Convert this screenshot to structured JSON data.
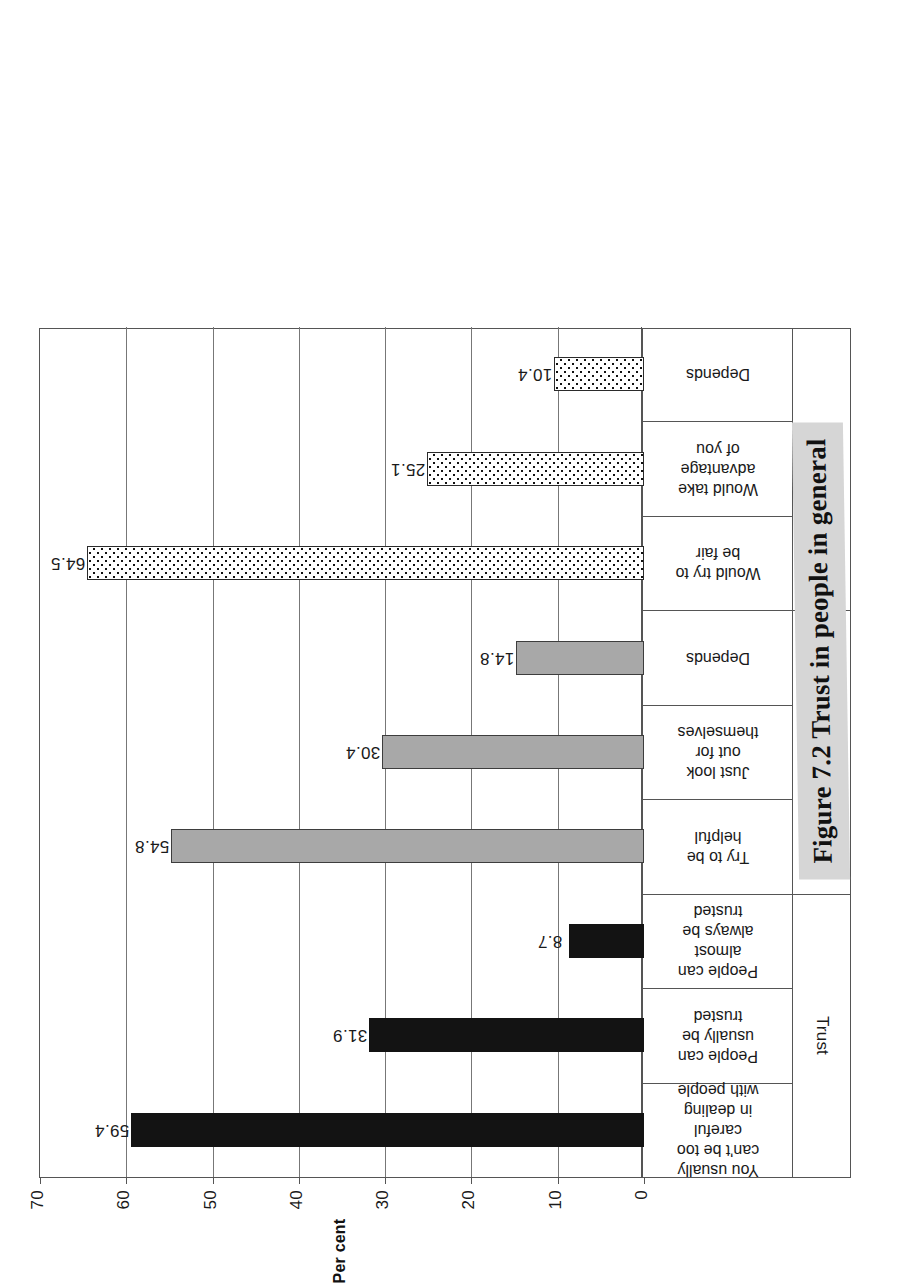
{
  "caption": {
    "text": "Figure 7.2  Trust in people in general"
  },
  "chart_data": {
    "type": "bar",
    "title": "",
    "xlabel": "",
    "ylabel": "Per cent",
    "ylim": [
      0,
      70
    ],
    "yticks": [
      "0",
      "10",
      "20",
      "30",
      "40",
      "50",
      "60",
      "70"
    ],
    "grid": true,
    "legend": "none",
    "orientation": "vertical-bars-on-rotated-page",
    "groups": [
      {
        "name": "Trust",
        "fill": "solid-black",
        "color": "#131313",
        "categories": [
          "You usually can't be too careful\nin dealing with people",
          "People can usually be trusted",
          "People can almost always be\ntrusted"
        ],
        "values": [
          59.4,
          31.9,
          8.7
        ]
      },
      {
        "name": "Helpfulness",
        "fill": "solid-gray",
        "color": "#a8a8a8",
        "categories": [
          "Try to be helpful",
          "Just look out for themselves",
          "Depends"
        ],
        "values": [
          54.8,
          30.4,
          14.8
        ]
      },
      {
        "name": "Fairness",
        "fill": "white-dotted",
        "color": "#ffffff",
        "categories": [
          "Would try to be fair",
          "Would take advantage of you",
          "Depends"
        ],
        "values": [
          64.5,
          25.1,
          10.4
        ]
      }
    ],
    "categories": [
      "You usually can't be too careful\nin dealing with people",
      "People can usually be trusted",
      "People can almost always be\ntrusted",
      "Try to be helpful",
      "Just look out for themselves",
      "Depends",
      "Would try to be fair",
      "Would take advantage of you",
      "Depends"
    ],
    "values": [
      59.4,
      31.9,
      8.7,
      54.8,
      30.4,
      14.8,
      64.5,
      25.1,
      10.4
    ],
    "value_labels": [
      "59.4",
      "31.9",
      "8.7",
      "54.8",
      "30.4",
      "14.8",
      "64.5",
      "25.1",
      "10.4"
    ]
  }
}
